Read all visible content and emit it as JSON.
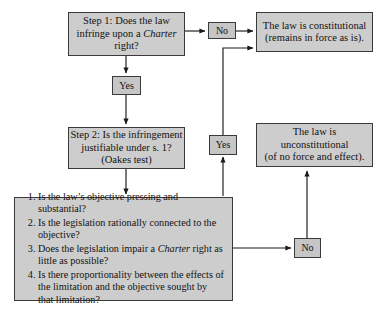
{
  "diagram": {
    "colors": {
      "node_fill": "#cdcdcd",
      "node_border": "#3a3a3a",
      "connector": "#1a1a1a",
      "background": "#ffffff"
    },
    "nodes": {
      "step1": {
        "lines": [
          "Step 1: Does the law",
          "infringe upon a ",
          "right?"
        ],
        "line1": "Step 1: Does the law",
        "line2_pre": "infringe upon a ",
        "line2_em": "Charter",
        "line3": "right?"
      },
      "constitutional": {
        "line1": "The law is constitutional",
        "line2": "(remains in force as is)."
      },
      "step2": {
        "line1": "Step 2: Is the infringement",
        "line2": "justifiable under s. 1?",
        "line3": "(Oakes test)"
      },
      "unconstitutional": {
        "line1": "The law is",
        "line2": "unconstitutional",
        "line3": "(of no force and effect)."
      },
      "oakes_list": {
        "items": [
          {
            "pre": "Is the law’s objective pressing and substantial?",
            "em": "",
            "post": ""
          },
          {
            "pre": "Is the legislation rationally connected to the objective?",
            "em": "",
            "post": ""
          },
          {
            "pre": "Does the legislation impair a ",
            "em": "Charter",
            "post": " right as little as possible?"
          },
          {
            "pre": "Is there proportionality between the effects of the limitation and the objective sought by that limitation?",
            "em": "",
            "post": ""
          }
        ]
      }
    },
    "edge_labels": {
      "no_top": "No",
      "yes_left": "Yes",
      "yes_right": "Yes",
      "no_bottom": "No"
    }
  }
}
